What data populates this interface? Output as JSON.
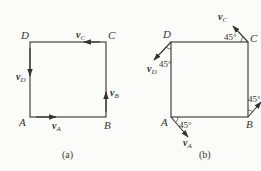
{
  "diagram_a": {
    "caption": "(a)",
    "corners": {
      "A": "A",
      "B": "B",
      "C": "C",
      "D": "D"
    },
    "velocities": {
      "A": {
        "v": "v",
        "sub": "A",
        "direction": "right"
      },
      "B": {
        "v": "v",
        "sub": "B",
        "direction": "up"
      },
      "C": {
        "v": "v",
        "sub": "C",
        "direction": "left"
      },
      "D": {
        "v": "v",
        "sub": "D",
        "direction": "down"
      }
    }
  },
  "diagram_b": {
    "caption": "(b)",
    "corners": {
      "A": "A",
      "B": "B",
      "C": "C",
      "D": "D"
    },
    "angle_label": "45°",
    "velocities": {
      "A": {
        "v": "v",
        "sub": "A",
        "direction": "down-right 45°"
      },
      "B": {
        "v": "v",
        "sub": "B",
        "direction": "up-right 45°"
      },
      "C": {
        "v": "v",
        "sub": "C",
        "direction": "up-left 45°"
      },
      "D": {
        "v": "v",
        "sub": "D",
        "direction": "down-left 45°"
      }
    }
  },
  "colors": {
    "line": "#333333",
    "background": "#fbfbf9"
  }
}
